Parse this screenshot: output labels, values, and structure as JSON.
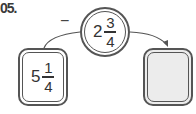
{
  "problem": {
    "number_label": "05.",
    "operator": "−",
    "operand": {
      "whole": "2",
      "numerator": "3",
      "denominator": "4"
    },
    "start_value": {
      "whole": "5",
      "numerator": "1",
      "denominator": "4"
    },
    "result_box": {
      "value": ""
    }
  }
}
